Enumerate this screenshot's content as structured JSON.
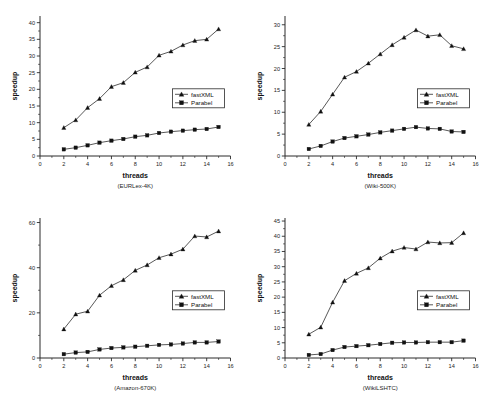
{
  "figure": {
    "shared_xlabel": "threads",
    "shared_ylabel": "speedup",
    "legend_entries": [
      "fastXML",
      "Parabel"
    ]
  },
  "chart_data": [
    {
      "type": "line",
      "title": "",
      "caption": "(EURLex-4K)",
      "xlabel": "threads",
      "ylabel": "speedup",
      "xlim": [
        0,
        16
      ],
      "ylim": [
        0,
        42
      ],
      "xticks": [
        0,
        2,
        4,
        6,
        8,
        10,
        12,
        14,
        16
      ],
      "yticks": [
        0,
        5,
        10,
        15,
        20,
        25,
        30,
        35,
        40
      ],
      "grid": false,
      "legend_position": "center-right",
      "x": [
        2,
        3,
        4,
        5,
        6,
        7,
        8,
        9,
        10,
        11,
        12,
        13,
        14,
        15
      ],
      "series": [
        {
          "name": "fastXML",
          "marker": "triangle",
          "values": [
            8.5,
            10.8,
            14.5,
            17.2,
            20.8,
            22.0,
            25.1,
            26.7,
            30.2,
            31.4,
            33.3,
            34.6,
            35.0,
            38.1
          ]
        },
        {
          "name": "Parabel",
          "marker": "square",
          "values": [
            2.0,
            2.5,
            3.2,
            4.0,
            4.6,
            5.1,
            5.8,
            6.2,
            6.9,
            7.3,
            7.6,
            7.9,
            8.1,
            8.7
          ]
        }
      ]
    },
    {
      "type": "line",
      "title": "",
      "caption": "(Wiki-500K)",
      "xlabel": "threads",
      "ylabel": "speedup",
      "xlim": [
        0,
        16
      ],
      "ylim": [
        0,
        32
      ],
      "xticks": [
        0,
        2,
        4,
        6,
        8,
        10,
        12,
        14,
        16
      ],
      "yticks": [
        0,
        5,
        10,
        15,
        20,
        25,
        30
      ],
      "grid": false,
      "legend_position": "center-right",
      "x": [
        2,
        3,
        4,
        5,
        6,
        7,
        8,
        9,
        10,
        11,
        12,
        13,
        14,
        15
      ],
      "series": [
        {
          "name": "fastXML",
          "marker": "triangle",
          "values": [
            7.2,
            10.2,
            14.1,
            18.0,
            19.3,
            21.2,
            23.3,
            25.4,
            27.1,
            28.8,
            27.4,
            27.7,
            25.2,
            24.5
          ]
        },
        {
          "name": "Parabel",
          "marker": "square",
          "values": [
            1.6,
            2.3,
            3.3,
            4.1,
            4.5,
            4.9,
            5.4,
            5.8,
            6.2,
            6.6,
            6.3,
            6.2,
            5.6,
            5.5
          ]
        }
      ]
    },
    {
      "type": "line",
      "title": "",
      "caption": "(Amazon-670K)",
      "xlabel": "threads",
      "ylabel": "speedup",
      "xlim": [
        0,
        16
      ],
      "ylim": [
        0,
        62
      ],
      "xticks": [
        0,
        2,
        4,
        6,
        8,
        10,
        12,
        14,
        16
      ],
      "yticks": [
        0,
        20,
        40,
        60
      ],
      "grid": false,
      "legend_position": "center-right",
      "x": [
        2,
        3,
        4,
        5,
        6,
        7,
        8,
        9,
        10,
        11,
        12,
        13,
        14,
        15
      ],
      "series": [
        {
          "name": "fastXML",
          "marker": "triangle",
          "values": [
            12.8,
            19.4,
            20.7,
            27.8,
            32.0,
            34.6,
            38.8,
            41.2,
            44.4,
            46.0,
            48.2,
            54.0,
            53.6,
            56.2
          ]
        },
        {
          "name": "Parabel",
          "marker": "square",
          "values": [
            1.7,
            2.4,
            2.7,
            3.8,
            4.4,
            4.7,
            5.0,
            5.4,
            5.8,
            6.0,
            6.4,
            6.9,
            6.9,
            7.3
          ]
        }
      ]
    },
    {
      "type": "line",
      "title": "",
      "caption": "(WikiLSHTC)",
      "xlabel": "threads",
      "ylabel": "speedup",
      "xlim": [
        0,
        16
      ],
      "ylim": [
        0,
        46
      ],
      "xticks": [
        0,
        2,
        4,
        6,
        8,
        10,
        12,
        14,
        16
      ],
      "yticks": [
        0,
        5,
        10,
        15,
        20,
        25,
        30,
        35,
        40,
        45
      ],
      "grid": false,
      "legend_position": "center-right",
      "x": [
        2,
        3,
        4,
        5,
        6,
        7,
        8,
        9,
        10,
        11,
        12,
        13,
        14,
        15
      ],
      "series": [
        {
          "name": "fastXML",
          "marker": "triangle",
          "values": [
            7.8,
            10.1,
            18.3,
            25.4,
            27.8,
            29.6,
            32.8,
            35.1,
            36.3,
            35.8,
            38.1,
            37.8,
            37.9,
            41.1
          ]
        },
        {
          "name": "Parabel",
          "marker": "square",
          "values": [
            1.0,
            1.3,
            2.6,
            3.6,
            3.9,
            4.2,
            4.6,
            5.0,
            5.1,
            5.1,
            5.2,
            5.2,
            5.2,
            5.7
          ]
        }
      ]
    }
  ]
}
